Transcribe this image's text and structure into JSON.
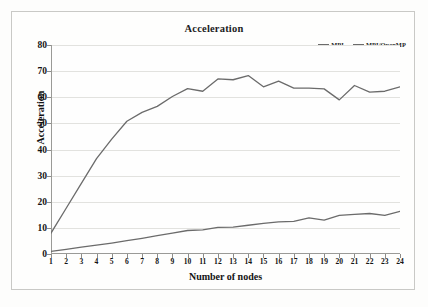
{
  "chart_data": {
    "type": "line",
    "title": "Acceleration",
    "xlabel": "Number of nodes",
    "ylabel": "Acceleration",
    "x": [
      1,
      2,
      3,
      4,
      5,
      6,
      7,
      8,
      9,
      10,
      11,
      12,
      13,
      14,
      15,
      16,
      17,
      18,
      19,
      20,
      21,
      22,
      23,
      24
    ],
    "xlim": [
      1,
      24
    ],
    "ylim": [
      0,
      80
    ],
    "yticks": [
      0,
      10,
      20,
      30,
      40,
      50,
      60,
      70,
      80
    ],
    "xticks": [
      1,
      2,
      3,
      4,
      5,
      6,
      7,
      8,
      9,
      10,
      11,
      12,
      13,
      14,
      15,
      16,
      17,
      18,
      19,
      20,
      21,
      22,
      23,
      24
    ],
    "grid": true,
    "legend_position": "top-right",
    "series": [
      {
        "name": "MPI",
        "color": "#6b6b6b",
        "values": [
          1.0,
          1.8,
          2.6,
          3.4,
          4.2,
          5.1,
          6.0,
          7.0,
          8.0,
          9.0,
          9.2,
          10.2,
          10.3,
          11.0,
          11.7,
          12.3,
          12.5,
          13.8,
          13.0,
          14.8,
          15.2,
          15.5,
          14.8,
          16.3
        ]
      },
      {
        "name": "MPI/OpenMP",
        "color": "#6b6b6b",
        "values": [
          8.0,
          17.5,
          27.0,
          36.5,
          44.0,
          50.8,
          54.2,
          56.5,
          60.3,
          63.3,
          62.3,
          67.0,
          66.7,
          68.3,
          64.0,
          66.2,
          63.5,
          63.5,
          63.2,
          59.0,
          64.5,
          62.0,
          62.3,
          64.0
        ]
      }
    ]
  },
  "legend": {
    "items": [
      {
        "label": "MPI"
      },
      {
        "label": "MPI/OpenMP"
      }
    ]
  }
}
